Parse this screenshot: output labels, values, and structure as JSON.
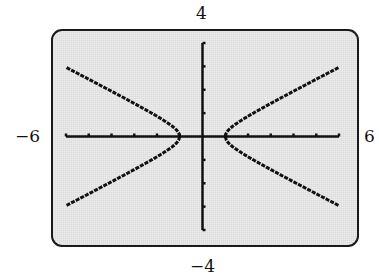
{
  "window_labels": {
    "ymax": "4",
    "ymin": "−4",
    "xmin": "−6",
    "xmax": "6"
  },
  "chart_data": {
    "type": "line",
    "title": "",
    "equation": "x^2 - 4y^2 = 1",
    "xlabel": "",
    "ylabel": "",
    "xlim": [
      -6,
      6
    ],
    "ylim": [
      -4,
      4
    ],
    "x_ticks": [
      -6,
      -5,
      -4,
      -3,
      -2,
      -1,
      0,
      1,
      2,
      3,
      4,
      5,
      6
    ],
    "y_ticks": [
      -4,
      -3,
      -2,
      -1,
      0,
      1,
      2,
      3,
      4
    ],
    "grid": false,
    "legend": null,
    "vertices": [
      [
        -1,
        0
      ],
      [
        1,
        0
      ]
    ],
    "series": [
      {
        "name": "right branch upper",
        "x": [
          1,
          1.5,
          2,
          3,
          4,
          5,
          6
        ],
        "y": [
          0,
          0.56,
          0.87,
          1.41,
          1.94,
          2.45,
          2.96
        ]
      },
      {
        "name": "right branch lower",
        "x": [
          1,
          1.5,
          2,
          3,
          4,
          5,
          6
        ],
        "y": [
          0,
          -0.56,
          -0.87,
          -1.41,
          -1.94,
          -2.45,
          -2.96
        ]
      },
      {
        "name": "left branch upper",
        "x": [
          -1,
          -1.5,
          -2,
          -3,
          -4,
          -5,
          -6
        ],
        "y": [
          0,
          0.56,
          0.87,
          1.41,
          1.94,
          2.45,
          2.96
        ]
      },
      {
        "name": "left branch lower",
        "x": [
          -1,
          -1.5,
          -2,
          -3,
          -4,
          -5,
          -6
        ],
        "y": [
          0,
          -0.56,
          -0.87,
          -1.41,
          -1.94,
          -2.45,
          -2.96
        ]
      }
    ]
  }
}
